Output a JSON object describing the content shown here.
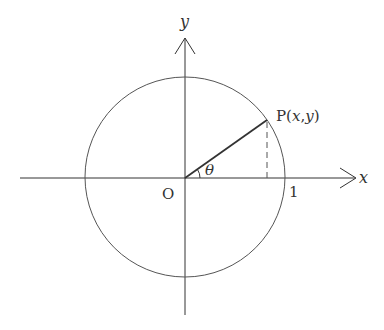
{
  "diagram": {
    "type": "unit-circle",
    "labels": {
      "y_axis": "y",
      "x_axis": "x",
      "origin": "O",
      "point": "P(x,y)",
      "point_prefix": "P(",
      "point_x": "x",
      "point_comma": ",",
      "point_y": "y",
      "point_suffix": ")",
      "angle": "θ",
      "unit_mark": "1"
    },
    "colors": {
      "axes": "#333333",
      "circle": "#555555",
      "radius": "#333333",
      "dashed": "#555555"
    }
  }
}
